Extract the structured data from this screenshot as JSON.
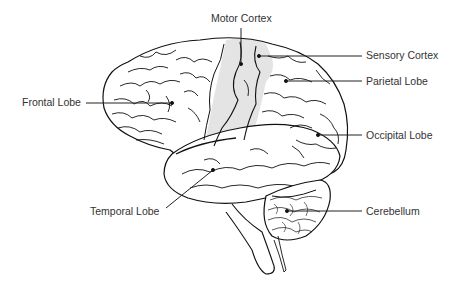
{
  "diagram": {
    "labels": [
      {
        "id": "motor-cortex",
        "text": "Motor Cortex"
      },
      {
        "id": "sensory-cortex",
        "text": "Sensory Cortex"
      },
      {
        "id": "parietal-lobe",
        "text": "Parietal Lobe"
      },
      {
        "id": "frontal-lobe",
        "text": "Frontal Lobe"
      },
      {
        "id": "occipital-lobe",
        "text": "Occipital Lobe"
      },
      {
        "id": "temporal-lobe",
        "text": "Temporal Lobe"
      },
      {
        "id": "cerebellum",
        "text": "Cerebellum"
      }
    ],
    "colors": {
      "outline": "#111111",
      "cortex_shade": "#e4e4e4",
      "leader_line": "#222222",
      "text": "#333333",
      "background": "#ffffff"
    }
  }
}
